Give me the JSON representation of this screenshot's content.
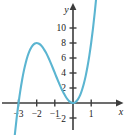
{
  "figure": {
    "background_color": "#ffffff",
    "axis_color": "#3c3c3c",
    "label_color": "#1a1a1a"
  },
  "chart_data": {
    "type": "line",
    "title": "",
    "subtitle": "",
    "xlabel": "x",
    "ylabel": "y",
    "grid": false,
    "legend": "none",
    "curve_color": "#5bb5d1",
    "xlim": [
      -3.45,
      1.45
    ],
    "ylim": [
      -2.9,
      12.2
    ],
    "xticks": [
      -3,
      -2,
      -1,
      1
    ],
    "xtick_labels": [
      "−3",
      "−2",
      "−1",
      "1"
    ],
    "yticks": [
      2,
      4,
      6,
      8,
      10,
      -2
    ],
    "ytick_labels": [
      "2",
      "4",
      "6",
      "8",
      "10",
      "−2"
    ],
    "annotations": {
      "x_axis_arrow": "right",
      "y_axis_arrow": "up",
      "local_max_point": [
        -2,
        8
      ],
      "root_simple": -3,
      "root_double": 0
    },
    "series": [
      {
        "name": "curve",
        "equation": "y = x^2 (x + 3)",
        "x": [
          -3.45,
          -3.3,
          -3.2,
          -3.1,
          -3.0,
          -2.9,
          -2.8,
          -2.7,
          -2.6,
          -2.5,
          -2.4,
          -2.3,
          -2.2,
          -2.1,
          -2.0,
          -1.9,
          -1.8,
          -1.7,
          -1.6,
          -1.5,
          -1.4,
          -1.3,
          -1.2,
          -1.1,
          -1.0,
          -0.9,
          -0.8,
          -0.7,
          -0.6,
          -0.5,
          -0.4,
          -0.3,
          -0.2,
          -0.1,
          0.0,
          0.1,
          0.2,
          0.3,
          0.4,
          0.5,
          0.6,
          0.7,
          0.8,
          0.9,
          1.0,
          1.1,
          1.2,
          1.3,
          1.4,
          1.45
        ],
        "y": [
          -5.36,
          -3.27,
          -2.05,
          -0.96,
          0.0,
          0.84,
          1.57,
          2.19,
          2.7,
          3.13,
          3.46,
          3.7,
          3.87,
          3.97,
          4.0,
          3.97,
          3.89,
          3.76,
          3.58,
          3.38,
          3.14,
          2.87,
          2.59,
          2.3,
          2.0,
          1.7,
          1.41,
          1.13,
          0.86,
          0.63,
          0.42,
          0.24,
          0.11,
          0.03,
          0.0,
          0.03,
          0.13,
          0.3,
          0.54,
          0.88,
          1.3,
          1.81,
          2.43,
          3.16,
          4.0,
          4.96,
          6.05,
          7.26,
          8.62,
          9.36
        ]
      }
    ],
    "y_scale_note": "plotted curve uses 2x vertical scaling of x^2(x+3) so peak reads 8 at x=-2"
  }
}
